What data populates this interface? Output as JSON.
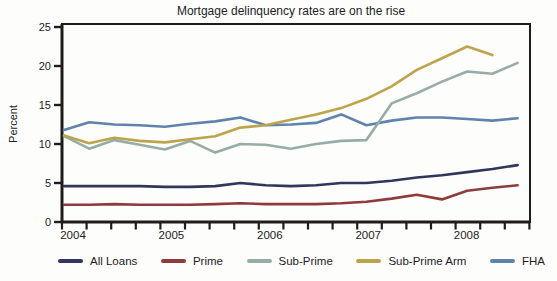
{
  "chart_data": {
    "type": "line",
    "title": "Mortgage delinquency rates are on the rise",
    "xlabel": "",
    "ylabel": "Percent",
    "ylim": [
      0,
      25
    ],
    "yticks": [
      0,
      5,
      10,
      15,
      20,
      25
    ],
    "x_years": [
      "2004",
      "2005",
      "2006",
      "2007",
      "2008"
    ],
    "x_quarters": [
      "2004Q1",
      "2004Q2",
      "2004Q3",
      "2004Q4",
      "2005Q1",
      "2005Q2",
      "2005Q3",
      "2005Q4",
      "2006Q1",
      "2006Q2",
      "2006Q3",
      "2006Q4",
      "2007Q1",
      "2007Q2",
      "2007Q3",
      "2007Q4",
      "2008Q1",
      "2008Q2",
      "2008Q3"
    ],
    "grid": false,
    "legend_position": "bottom",
    "axis_color": "#1f1d1b",
    "series": [
      {
        "name": "All Loans",
        "color": "#32355c",
        "values": [
          4.6,
          4.6,
          4.6,
          4.6,
          4.5,
          4.5,
          4.6,
          5.0,
          4.7,
          4.6,
          4.7,
          5.0,
          5.0,
          5.3,
          5.7,
          6.0,
          6.4,
          6.8,
          7.3
        ]
      },
      {
        "name": "Prime",
        "color": "#8e3b3d",
        "values": [
          2.2,
          2.2,
          2.3,
          2.2,
          2.2,
          2.2,
          2.3,
          2.4,
          2.3,
          2.3,
          2.3,
          2.4,
          2.6,
          3.0,
          3.5,
          2.9,
          4.0,
          4.4,
          4.7
        ]
      },
      {
        "name": "Sub-Prime",
        "color": "#96ada7",
        "values": [
          11.0,
          9.4,
          10.5,
          9.9,
          9.3,
          10.4,
          8.9,
          10.0,
          9.9,
          9.4,
          10.0,
          10.4,
          10.5,
          15.2,
          16.5,
          18.0,
          19.3,
          19.0,
          20.4
        ]
      },
      {
        "name": "Sub-Prime Arm",
        "color": "#bda44c",
        "values": [
          11.1,
          10.1,
          10.8,
          10.4,
          10.2,
          10.6,
          11.0,
          12.1,
          12.4,
          13.1,
          13.8,
          14.6,
          15.8,
          17.4,
          19.5,
          21.0,
          22.5,
          21.4
        ]
      },
      {
        "name": "FHA",
        "color": "#5f83ad",
        "values": [
          11.8,
          12.8,
          12.5,
          12.4,
          12.2,
          12.6,
          12.9,
          13.4,
          12.4,
          12.5,
          12.7,
          13.8,
          12.4,
          13.0,
          13.4,
          13.4,
          13.2,
          13.0,
          13.3
        ]
      }
    ]
  }
}
